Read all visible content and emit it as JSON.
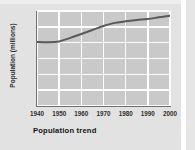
{
  "chart_data": {
    "type": "line",
    "title": "Population trend",
    "xlabel": "",
    "ylabel": "Population (millions)",
    "x": [
      1940,
      1945,
      1950,
      1955,
      1960,
      1965,
      1970,
      1975,
      1980,
      1985,
      1990,
      1995,
      2000
    ],
    "values": [
      40.5,
      40.3,
      40.8,
      43.0,
      45.5,
      48.0,
      50.5,
      52.5,
      53.5,
      54.3,
      55.0,
      56.0,
      57.0
    ],
    "series": [
      {
        "name": "Population",
        "values": [
          40.5,
          40.3,
          40.8,
          43.0,
          45.5,
          48.0,
          50.5,
          52.5,
          53.5,
          54.3,
          55.0,
          56.0,
          57.0
        ]
      }
    ],
    "xticks": [
      "1940",
      "1950",
      "1960",
      "1970",
      "1980",
      "1990",
      "2000"
    ],
    "yticks": [
      "0",
      "10",
      "20",
      "30",
      "40",
      "50",
      "60"
    ],
    "xlim": [
      1940,
      2000
    ],
    "ylim": [
      0,
      60
    ],
    "grid": true,
    "legend": "none",
    "line_color": "#595959",
    "plot_bg": "#c9c9c9",
    "grid_color": "#fdfdfd",
    "panel_bg": "#e2e2e2"
  }
}
